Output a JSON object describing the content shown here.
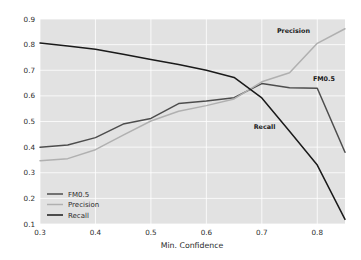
{
  "chart_data": {
    "type": "line",
    "title": "",
    "xlabel": "Min. Confidence",
    "ylabel": "",
    "xlim": [
      0.3,
      0.85
    ],
    "ylim": [
      0.1,
      0.9
    ],
    "grid": true,
    "legend_position": "lower left",
    "xticks": [
      0.3,
      0.4,
      0.5,
      0.6,
      0.7,
      0.8
    ],
    "xtick_labels": [
      "0.3",
      "0.4",
      "0.5",
      "0.6",
      "0.7",
      "0.8"
    ],
    "yticks": [
      0.1,
      0.2,
      0.3,
      0.4,
      0.5,
      0.6,
      0.7,
      0.8,
      0.9
    ],
    "ytick_labels": [
      "0.1",
      "0.2",
      "0.3",
      "0.4",
      "0.5",
      "0.6",
      "0.7",
      "0.8",
      "0.9"
    ],
    "x": [
      0.3,
      0.35,
      0.4,
      0.45,
      0.5,
      0.55,
      0.6,
      0.65,
      0.7,
      0.75,
      0.8,
      0.85
    ],
    "series": [
      {
        "name": "FM0.5",
        "color": "#4d4d4d",
        "width": 1.5,
        "values": [
          0.4,
          0.408,
          0.437,
          0.49,
          0.512,
          0.57,
          0.58,
          0.593,
          0.648,
          0.632,
          0.63,
          0.38
        ]
      },
      {
        "name": "Precision",
        "color": "#b0b0b0",
        "width": 1.5,
        "values": [
          0.347,
          0.355,
          0.39,
          0.447,
          0.502,
          0.54,
          0.562,
          0.588,
          0.655,
          0.69,
          0.805,
          0.862
        ]
      },
      {
        "name": "Recall",
        "color": "#1a1a1a",
        "width": 1.5,
        "values": [
          0.806,
          0.795,
          0.782,
          0.762,
          0.742,
          0.722,
          0.7,
          0.672,
          0.592,
          0.462,
          0.33,
          0.118
        ]
      }
    ],
    "annotations": [
      {
        "text": "Precision",
        "x": 0.757,
        "y": 0.845
      },
      {
        "text": "FM0.5",
        "x": 0.812,
        "y": 0.66
      },
      {
        "text": "Recall",
        "x": 0.705,
        "y": 0.47
      }
    ],
    "legend_entries": [
      {
        "label": "FM0.5",
        "color": "#4d4d4d"
      },
      {
        "label": "Precision",
        "color": "#b0b0b0"
      },
      {
        "label": "Recall",
        "color": "#1a1a1a"
      }
    ],
    "colors": {
      "plot_background": "#e2e2e2",
      "figure_background": "#ffffff",
      "gridline": "#ffffff",
      "text": "#2b2b2b"
    }
  }
}
